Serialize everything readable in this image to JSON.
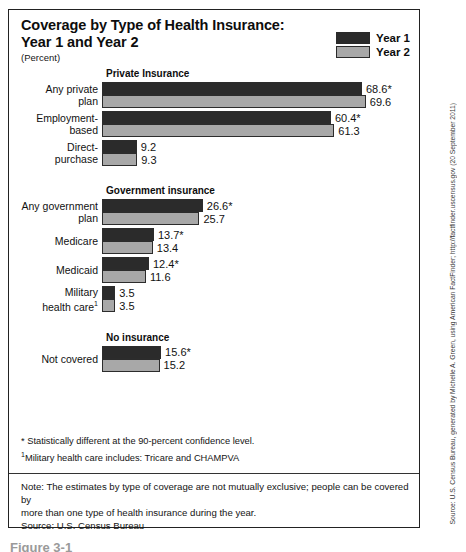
{
  "figure": {
    "title_line1": "Coverage by Type of Health Insurance:",
    "title_line2": "Year 1 and Year 2",
    "units": "(Percent)"
  },
  "legend": {
    "items": [
      {
        "label": "Year 1",
        "color": "#2b2b2b"
      },
      {
        "label": "Year 2",
        "color": "#a8a8a8"
      }
    ]
  },
  "colors": {
    "year1": "#2b2b2b",
    "year2": "#a8a8a8",
    "border": "#2c2c2c",
    "frame": "#222222"
  },
  "footnotes": {
    "star": "* Statistically different at the 90-percent confidence level.",
    "dagger_marker": "1",
    "dagger": "Military health care includes: Tricare and CHAMPVA"
  },
  "note": {
    "line1": "Note:  The estimates by type of coverage are not mutually exclusive; people can be covered by",
    "line2": "more than one type of health insurance during the year.",
    "source": "Source: U.S. Census Bureau"
  },
  "source_credit": "Source: U.S. Census Bureau, generated by Michelle A. Green, using American FactFinder; http://factfinder.uscensus.gov (20 September 2011)",
  "caption_fragment": "Figure 3-1",
  "chart_data": {
    "type": "bar",
    "orientation": "horizontal",
    "title": "Coverage by Type of Health Insurance: Year 1 and Year 2",
    "xlabel": "Percent",
    "ylabel": "",
    "xlim": [
      0,
      70
    ],
    "grid": false,
    "legend_position": "top-right",
    "series": [
      {
        "name": "Year 1",
        "color": "#2b2b2b"
      },
      {
        "name": "Year 2",
        "color": "#a8a8a8"
      }
    ],
    "sections": [
      {
        "heading": "Private Insurance",
        "categories": [
          {
            "label_line1": "Any private",
            "label_line2": "plan",
            "values": [
              68.6,
              69.6
            ],
            "value_labels": [
              "68.6*",
              "69.6"
            ],
            "significant": [
              true,
              false
            ]
          },
          {
            "label_line1": "Employment-",
            "label_line2": "based",
            "values": [
              60.4,
              61.3
            ],
            "value_labels": [
              "60.4*",
              "61.3"
            ],
            "significant": [
              true,
              false
            ]
          },
          {
            "label_line1": "Direct-",
            "label_line2": "purchase",
            "values": [
              9.2,
              9.3
            ],
            "value_labels": [
              "9.2",
              "9.3"
            ],
            "significant": [
              false,
              false
            ]
          }
        ]
      },
      {
        "heading": "Government insurance",
        "categories": [
          {
            "label_line1": "Any government",
            "label_line2": "plan",
            "values": [
              26.6,
              25.7
            ],
            "value_labels": [
              "26.6*",
              "25.7"
            ],
            "significant": [
              true,
              false
            ]
          },
          {
            "label_line1": "Medicare",
            "label_line2": "",
            "values": [
              13.7,
              13.4
            ],
            "value_labels": [
              "13.7*",
              "13.4"
            ],
            "significant": [
              true,
              false
            ]
          },
          {
            "label_line1": "Medicaid",
            "label_line2": "",
            "values": [
              12.4,
              11.6
            ],
            "value_labels": [
              "12.4*",
              "11.6"
            ],
            "significant": [
              true,
              false
            ]
          },
          {
            "label_line1": "Military",
            "label_line2": "health care",
            "label_sup": "1",
            "values": [
              3.5,
              3.5
            ],
            "value_labels": [
              "3.5",
              "3.5"
            ],
            "significant": [
              false,
              false
            ]
          }
        ]
      },
      {
        "heading": "No insurance",
        "categories": [
          {
            "label_line1": "Not covered",
            "label_line2": "",
            "values": [
              15.6,
              15.2
            ],
            "value_labels": [
              "15.6*",
              "15.2"
            ],
            "significant": [
              true,
              false
            ]
          }
        ]
      }
    ]
  }
}
